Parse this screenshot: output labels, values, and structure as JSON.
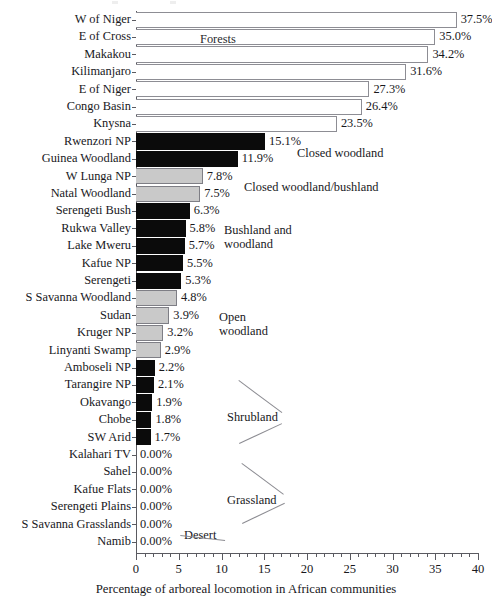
{
  "chart_data": {
    "type": "bar",
    "orientation": "horizontal",
    "title": "",
    "xlabel": "Percentage of arboreal locomotion in African communities",
    "ylabel": "",
    "xlim": [
      0,
      40
    ],
    "xticks": [
      0,
      5,
      10,
      15,
      20,
      25,
      30,
      35,
      40
    ],
    "xtick_labels": [
      "0",
      "5",
      "10",
      "15",
      "20",
      "25",
      "30",
      "35",
      "40"
    ],
    "minor_tick_step": 1,
    "grid": false,
    "legend": "none",
    "categories": [
      "W of Niger",
      "E of Cross",
      "Makakou",
      "Kilimanjaro",
      "E of Niger",
      "Congo Basin",
      "Knysna",
      "Rwenzori NP",
      "Guinea Woodland",
      "W Lunga NP",
      "Natal Woodland",
      "Serengeti Bush",
      "Rukwa Valley",
      "Lake Mweru",
      "Kafue NP",
      "Serengeti",
      "S Savanna Woodland",
      "Sudan",
      "Kruger NP",
      "Linyanti Swamp",
      "Amboseli NP",
      "Tarangire NP",
      "Okavango",
      "Chobe",
      "SW Arid",
      "Kalahari TV",
      "Sahel",
      "Kafue Flats",
      "Serengeti Plains",
      "S Savanna Grasslands",
      "Namib"
    ],
    "values": [
      37.5,
      35.0,
      34.2,
      31.6,
      27.3,
      26.4,
      23.5,
      15.1,
      11.9,
      7.8,
      7.5,
      6.3,
      5.8,
      5.7,
      5.5,
      5.3,
      4.8,
      3.9,
      3.2,
      2.9,
      2.2,
      2.1,
      1.9,
      1.8,
      1.7,
      0.0,
      0.0,
      0.0,
      0.0,
      0.0,
      0.0
    ],
    "value_labels": [
      "37.5%",
      "35.0%",
      "34.2%",
      "31.6%",
      "27.3%",
      "26.4%",
      "23.5%",
      "15.1%",
      "11.9%",
      "7.8%",
      "7.5%",
      "6.3%",
      "5.8%",
      "5.7%",
      "5.5%",
      "5.3%",
      "4.8%",
      "3.9%",
      "3.2%",
      "2.9%",
      "2.2%",
      "2.1%",
      "1.9%",
      "1.8%",
      "1.7%",
      "0.00%",
      "0.00%",
      "0.00%",
      "0.00%",
      "0.00%",
      "0.00%"
    ],
    "bar_fills": [
      "white",
      "white",
      "white",
      "white",
      "white",
      "white",
      "white",
      "black",
      "black",
      "gray",
      "gray",
      "black",
      "black",
      "black",
      "black",
      "black",
      "gray",
      "gray",
      "gray",
      "gray",
      "black",
      "black",
      "black",
      "black",
      "black",
      "none",
      "none",
      "none",
      "none",
      "none",
      "none"
    ],
    "habitat_groups": [
      {
        "label": "Forests",
        "categories_from": "W of Niger",
        "categories_to": "Knysna",
        "fill": "white"
      },
      {
        "label": "Closed woodland",
        "categories_from": "Rwenzori NP",
        "categories_to": "Guinea Woodland",
        "fill": "black"
      },
      {
        "label": "Closed woodland/bushland",
        "categories_from": "W Lunga NP",
        "categories_to": "Natal Woodland",
        "fill": "gray"
      },
      {
        "label": "Bushland and\nwoodland",
        "categories_from": "Serengeti Bush",
        "categories_to": "Serengeti",
        "fill": "black"
      },
      {
        "label": "Open\nwoodland",
        "categories_from": "S Savanna Woodland",
        "categories_to": "Linyanti Swamp",
        "fill": "gray"
      },
      {
        "label": "Shrubland",
        "categories_from": "Amboseli NP",
        "categories_to": "SW Arid",
        "fill": "black"
      },
      {
        "label": "Grassland",
        "categories_from": "Kalahari TV",
        "categories_to": "S Savanna Grasslands",
        "fill": "none"
      },
      {
        "label": "Desert",
        "categories_from": "Namib",
        "categories_to": "Namib",
        "fill": "none"
      }
    ]
  },
  "annotations": {
    "forests": "Forests",
    "closed_woodland": "Closed woodland",
    "closed_woodland_bushland": "Closed woodland/bushland",
    "bushland_and_woodland_l1": "Bushland and",
    "bushland_and_woodland_l2": "woodland",
    "open_woodland_l1": "Open",
    "open_woodland_l2": "woodland",
    "shrubland": "Shrubland",
    "grassland": "Grassland",
    "desert": "Desert"
  },
  "colors": {
    "bar_black": "#0b0b0b",
    "bar_gray": "#c9c9c9",
    "bar_white": "#ffffff",
    "outline": "#8d8d94",
    "axis": "#5a5a60",
    "text": "#18181c",
    "leader": "#8c8c92"
  }
}
